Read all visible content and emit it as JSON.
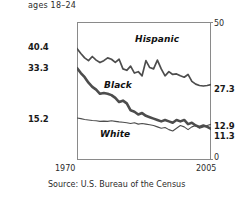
{
  "subtitle": "ages 18–24",
  "source_note": "Source: U.S. Bureau of the Census",
  "axis": {
    "top_right": "50",
    "bottom_right": "0",
    "x_start": "1970",
    "x_end": "2005",
    "left_hispanic_start": "40.4",
    "left_black_start": "33.3",
    "left_white_start": "15.2",
    "right_hispanic_end": "27.3",
    "right_mid_end": "12.9",
    "right_low_end": "11.3"
  },
  "series_labels": {
    "hispanic": "Hispanic",
    "black": "Black",
    "white": "White"
  },
  "colors": {
    "line": "#4d4d4d",
    "frame": "#8a8a8a",
    "text": "#1a1a1a"
  },
  "chart_data": {
    "type": "line",
    "title": "",
    "subtitle": "ages 18–24",
    "xlabel": "",
    "ylabel": "",
    "xlim": [
      1970,
      2005
    ],
    "ylim": [
      0,
      50
    ],
    "grid": false,
    "legend": "inline-labels",
    "x": [
      1970,
      1971,
      1972,
      1973,
      1974,
      1975,
      1976,
      1977,
      1978,
      1979,
      1980,
      1981,
      1982,
      1983,
      1984,
      1985,
      1986,
      1987,
      1988,
      1989,
      1990,
      1991,
      1992,
      1993,
      1994,
      1995,
      1996,
      1997,
      1998,
      1999,
      2000,
      2001,
      2002,
      2003,
      2004,
      2005
    ],
    "series": [
      {
        "name": "Hispanic",
        "start_value": 40.4,
        "end_value": 27.3,
        "values": [
          40.4,
          38.6,
          37.0,
          36.0,
          37.5,
          36.2,
          35.3,
          36.0,
          37.0,
          36.5,
          35.4,
          36.5,
          33.0,
          32.5,
          34.0,
          31.5,
          32.0,
          30.5,
          36.0,
          33.5,
          33.0,
          36.2,
          33.0,
          30.5,
          32.0,
          31.0,
          31.2,
          30.5,
          30.0,
          31.0,
          28.5,
          27.5,
          27.0,
          26.8,
          27.0,
          27.3
        ]
      },
      {
        "name": "Black",
        "start_value": 33.3,
        "end_value": 11.3,
        "values": [
          33.3,
          31.5,
          30.0,
          28.0,
          26.5,
          25.5,
          24.0,
          24.3,
          24.0,
          23.5,
          22.5,
          21.0,
          21.5,
          20.5,
          18.0,
          17.5,
          16.5,
          17.0,
          16.0,
          15.5,
          15.0,
          14.5,
          14.0,
          14.5,
          14.0,
          13.5,
          14.5,
          14.0,
          14.5,
          13.0,
          13.5,
          12.5,
          12.0,
          12.5,
          12.0,
          11.3
        ]
      },
      {
        "name": "White",
        "start_value": 15.2,
        "end_value": 12.9,
        "values": [
          15.2,
          15.0,
          14.7,
          14.5,
          14.3,
          14.2,
          14.0,
          14.1,
          14.0,
          14.2,
          14.0,
          13.8,
          13.7,
          13.5,
          13.2,
          13.5,
          13.0,
          13.2,
          13.0,
          12.8,
          12.5,
          12.0,
          11.5,
          11.8,
          11.0,
          10.5,
          11.5,
          12.5,
          12.0,
          11.0,
          12.0,
          12.5,
          11.5,
          12.0,
          12.5,
          12.9
        ]
      }
    ]
  }
}
